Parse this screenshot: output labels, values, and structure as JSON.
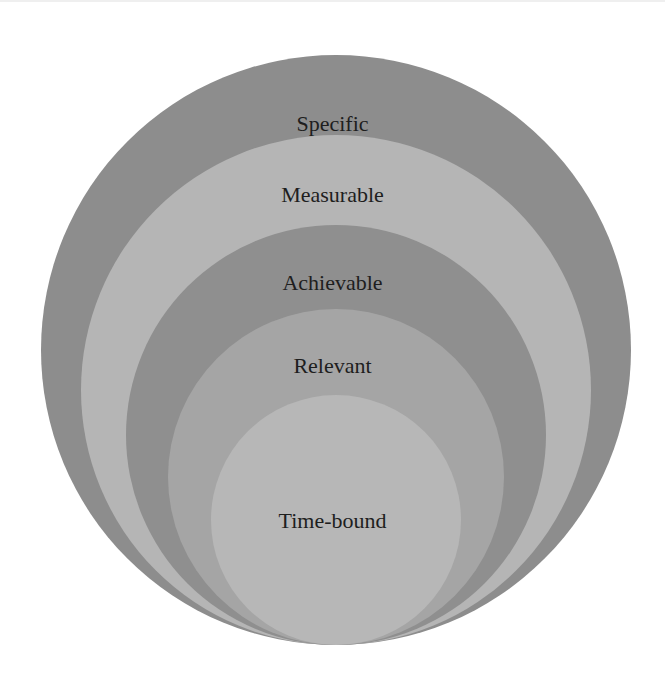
{
  "diagram": {
    "type": "nested-circles",
    "layers": [
      {
        "label": "Specific",
        "color": "#8d8d8d",
        "cx": 336,
        "bottom": 645,
        "r": 295,
        "label_y": 124
      },
      {
        "label": "Measurable",
        "color": "#b5b5b5",
        "cx": 336,
        "bottom": 645,
        "r": 255,
        "label_y": 195
      },
      {
        "label": "Achievable",
        "color": "#8f8f8f",
        "cx": 336,
        "bottom": 645,
        "r": 210,
        "label_y": 283
      },
      {
        "label": "Relevant",
        "color": "#a5a5a5",
        "cx": 336,
        "bottom": 645,
        "r": 168,
        "label_y": 366
      },
      {
        "label": "Time-bound",
        "color": "#b7b7b7",
        "cx": 336,
        "bottom": 645,
        "r": 125,
        "label_y": 521
      }
    ]
  }
}
